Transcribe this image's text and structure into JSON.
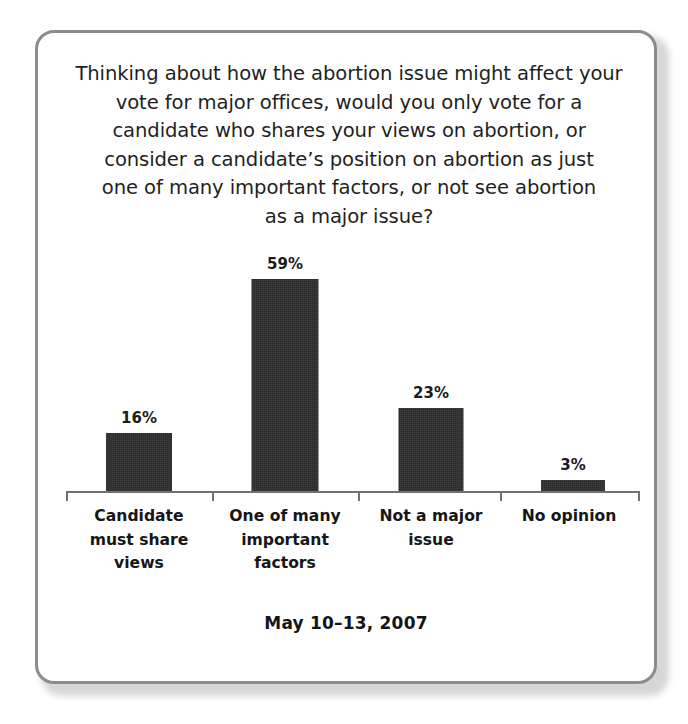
{
  "card": {
    "border_color": "#8c8c8c",
    "background": "#ffffff"
  },
  "chart_data": {
    "type": "bar",
    "title_lines": [
      "Thinking about how the abortion issue might affect your",
      "vote for major offices, would you only vote for a",
      "candidate who shares your views on abortion, or",
      "consider a candidate’s position on abortion as just",
      "one of many important factors, or not see abortion",
      "as a major issue?"
    ],
    "subtitle": "",
    "categories": [
      "Candidate must share views",
      "One of many important factors",
      "Not a major issue",
      "No opinion"
    ],
    "category_lines": [
      [
        "Candidate",
        "must share",
        "views"
      ],
      [
        "One of many",
        "important",
        "factors"
      ],
      [
        "Not a major",
        "issue"
      ],
      [
        "No opinion"
      ]
    ],
    "values": [
      16,
      59,
      23,
      3
    ],
    "value_labels": [
      "16%",
      "59%",
      "23%",
      "3%"
    ],
    "xlabel": "",
    "ylabel": "",
    "ylim": [
      0,
      65
    ],
    "grid": false,
    "legend": false,
    "bar_color": "#2b2b2b",
    "axis_color": "#707070",
    "footer": "May 10–13, 2007"
  }
}
